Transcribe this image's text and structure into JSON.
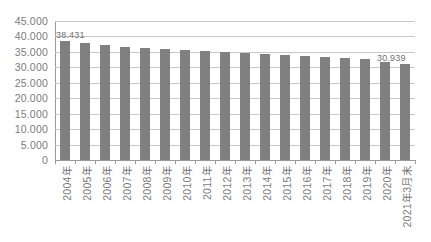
{
  "chart_data": {
    "type": "bar",
    "title": "",
    "subtitle": "",
    "xlabel": "",
    "ylabel": "",
    "ylim": [
      0,
      45000
    ],
    "grid": true,
    "legend": "none",
    "orientation": "vertical",
    "bar_color": "#808080",
    "gridline_color": "#c8c8c8",
    "axis_color": "#9a9a9a",
    "text_color": "#7b7b7b",
    "y_ticks": [
      0,
      5000,
      10000,
      15000,
      20000,
      25000,
      30000,
      35000,
      40000,
      45000
    ],
    "y_tick_labels": [
      "0",
      "5.000",
      "10.000",
      "15.000",
      "20.000",
      "25.000",
      "30.000",
      "35.000",
      "40.000",
      "45.000"
    ],
    "categories": [
      "2004年",
      "2005年",
      "2006年",
      "2007年",
      "2008年",
      "2009年",
      "2010年",
      "2011年",
      "2012年",
      "2013年",
      "2014年",
      "2015年",
      "2016年",
      "2017年",
      "2018年",
      "2019年",
      "2020年",
      "2021年3月末"
    ],
    "values": [
      38431,
      37800,
      37300,
      36700,
      36400,
      35900,
      35600,
      35400,
      35000,
      34700,
      34300,
      33900,
      33600,
      33300,
      33000,
      32600,
      31600,
      30939
    ],
    "data_labels": [
      {
        "index": 0,
        "text": "38.431"
      },
      {
        "index": 17,
        "text": "30.939"
      }
    ]
  }
}
